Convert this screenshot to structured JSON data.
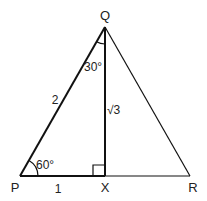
{
  "diagram": {
    "type": "triangle",
    "vertices": {
      "P": {
        "label": "P",
        "x": 20,
        "y": 176
      },
      "Q": {
        "label": "Q",
        "x": 105,
        "y": 27
      },
      "R": {
        "label": "R",
        "x": 190,
        "y": 176
      },
      "X": {
        "label": "X",
        "x": 105,
        "y": 176
      }
    },
    "labels": {
      "vertex_P": "P",
      "vertex_Q": "Q",
      "vertex_R": "R",
      "vertex_X": "X",
      "side_PQ": "2",
      "side_PX": "1",
      "side_QX": "√3",
      "angle_P": "60°",
      "angle_Q": "30°"
    },
    "annotations": {
      "right_angle_at": "X",
      "angle_P_value": "60°",
      "angle_PQX_value": "30°"
    }
  }
}
